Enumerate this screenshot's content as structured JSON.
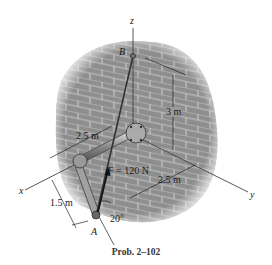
{
  "figure": {
    "caption": "Prob. 2–102",
    "axes": {
      "x": "x",
      "y": "y",
      "z": "z"
    },
    "points": {
      "A": "A",
      "B": "B"
    },
    "force": {
      "label": "F = 120 N",
      "magnitude": 120,
      "unit": "N"
    },
    "dimensions": {
      "pipe_along_x": "2.5 m",
      "pipe_down": "1.5 m",
      "y_offset": "2.5 m",
      "height_z": "3 m",
      "angle": "20°"
    },
    "colors": {
      "wall": "#8e8e8e",
      "brick_line": "#c4c4c4",
      "pipe": "#9a9a9a",
      "axis": "#444444",
      "force": "#111111"
    }
  }
}
